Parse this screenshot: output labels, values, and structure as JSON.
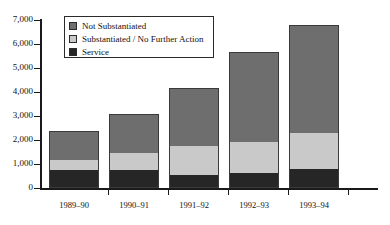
{
  "chart_data": {
    "type": "bar",
    "subtype": "stacked-vertical",
    "title": "",
    "xlabel": "",
    "ylabel": "",
    "categories": [
      "1989–90",
      "1990–91",
      "1991–92",
      "1992–93",
      "1993–94"
    ],
    "series": [
      {
        "name": "Service",
        "color": "#262626",
        "values": [
          750,
          750,
          550,
          625,
          800
        ]
      },
      {
        "name": "Substantiated / No Further Action",
        "color": "#c9c9c9",
        "values": [
          400,
          700,
          1200,
          1300,
          1500
        ]
      },
      {
        "name": "Not Substantiated",
        "color": "#6e6e6e",
        "values": [
          1225,
          1650,
          2400,
          3725,
          4500
        ]
      }
    ],
    "totals": [
      2375,
      3100,
      4150,
      5650,
      6800
    ],
    "ylim": [
      0,
      7000
    ],
    "yticks": [
      0,
      1000,
      2000,
      3000,
      4000,
      5000,
      6000,
      7000
    ],
    "ytick_labels": [
      "0",
      "1,000",
      "2,000",
      "3,000",
      "4,000",
      "5,000",
      "6,000",
      "7,000"
    ],
    "grid": false,
    "legend_position": "upper-left-inside",
    "legend_order": [
      "Not Substantiated",
      "Substantiated / No Further Action",
      "Service"
    ]
  },
  "legend": {
    "items": [
      {
        "label": "Not Substantiated",
        "color": "#6e6e6e"
      },
      {
        "label": "Substantiated / No Further Action",
        "color": "#c9c9c9"
      },
      {
        "label": "Service",
        "color": "#262626"
      }
    ]
  }
}
